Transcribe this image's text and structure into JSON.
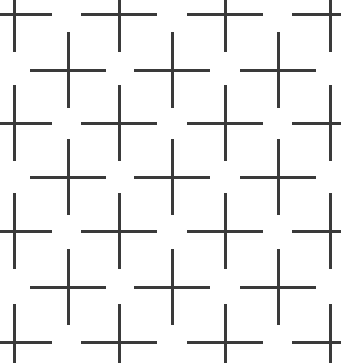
{
  "figure": {
    "kind": "illusion-figure",
    "name": "cross-grid-illusion",
    "width": 341,
    "height": 363,
    "background_color": "#ffffff",
    "line_color": "#3a3a3a",
    "line_width": 3,
    "arm_length": 38,
    "columns_x": [
      14,
      68,
      119,
      172,
      225,
      278,
      330
    ],
    "rows_y": [
      14,
      70,
      123,
      177,
      231,
      287,
      342
    ],
    "column_count": 7,
    "row_count": 7,
    "cross_count": 25,
    "pattern_note": "checkerboard parity: crosses drawn where (row+col) is even"
  },
  "chart_data": {
    "type": "scatter",
    "title": "",
    "xlabel": "",
    "ylabel": "",
    "grid": false,
    "legend": null,
    "xlim": [
      0,
      341
    ],
    "ylim": [
      0,
      363
    ],
    "series": [
      {
        "name": "cross-centers",
        "marker": "plus",
        "color": "#3a3a3a",
        "x": [
          14,
          119,
          225,
          330,
          68,
          172,
          278,
          14,
          119,
          225,
          330,
          68,
          172,
          278,
          14,
          119,
          225,
          330,
          68,
          172,
          278,
          14,
          119,
          225,
          330
        ],
        "y": [
          14,
          14,
          14,
          14,
          70,
          70,
          70,
          123,
          123,
          123,
          123,
          177,
          177,
          177,
          231,
          231,
          231,
          231,
          287,
          287,
          287,
          342,
          342,
          342,
          342
        ]
      }
    ]
  }
}
